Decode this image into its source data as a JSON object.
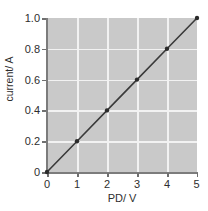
{
  "chart_data": {
    "type": "line",
    "title": "",
    "subtitle": "",
    "xlabel": "PD/ V",
    "ylabel": "current/ A",
    "x": [
      0,
      1,
      2,
      3,
      4,
      5
    ],
    "series": [
      {
        "name": "current vs PD",
        "values": [
          0.0,
          0.2,
          0.4,
          0.6,
          0.8,
          1.0
        ]
      }
    ],
    "xlim": [
      0,
      5
    ],
    "ylim": [
      0,
      1.0
    ],
    "xticks": [
      0,
      1,
      2,
      3,
      4,
      5
    ],
    "yticks": [
      0,
      0.2,
      0.4,
      0.6,
      0.8,
      1.0
    ],
    "xtick_labels": [
      "0",
      "1",
      "2",
      "3",
      "4",
      "5"
    ],
    "ytick_labels": [
      "0",
      "0.2",
      "0.4",
      "0.6",
      "0.8",
      "1.0"
    ],
    "grid": true,
    "legend": false,
    "legend_position": "none",
    "marker": "circle",
    "colors": {
      "plot_background": "#c9c9c9",
      "figure_background": "#ffffff",
      "gridline": "#f2f2f2",
      "axis": "#7c7c7c",
      "line": "#3a3a3a",
      "marker": "#2b2b2b",
      "text": "#2e2e2e"
    }
  }
}
